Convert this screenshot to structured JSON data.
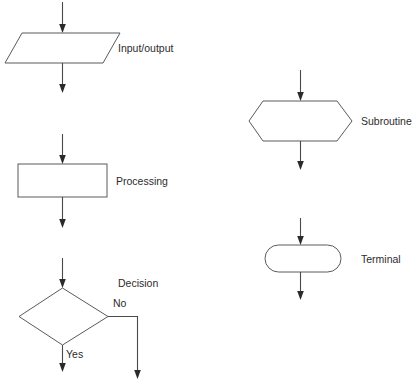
{
  "diagram": {
    "background_color": "#ffffff",
    "line_color": "#5a5a5a",
    "arrow_color": "#2b2b2b",
    "text_color": "#2c2c2c",
    "symbols": [
      {
        "id": "input-output",
        "shape": "parallelogram",
        "label": "Input/output",
        "label_x": 118,
        "label_y": 52
      },
      {
        "id": "processing",
        "shape": "rectangle",
        "label": "Processing",
        "label_x": 116,
        "label_y": 185
      },
      {
        "id": "decision",
        "shape": "diamond",
        "label": "Decision",
        "label_x": 118,
        "label_y": 287
      },
      {
        "id": "subroutine",
        "shape": "hexagon",
        "label": "Subroutine",
        "label_x": 361,
        "label_y": 125
      },
      {
        "id": "terminal",
        "shape": "stadium",
        "label": "Terminal",
        "label_x": 361,
        "label_y": 263
      }
    ],
    "branches": [
      {
        "id": "decision-no",
        "label": "No",
        "label_x": 113,
        "label_y": 307
      },
      {
        "id": "decision-yes",
        "label": "Yes",
        "label_x": 66,
        "label_y": 358
      }
    ]
  }
}
